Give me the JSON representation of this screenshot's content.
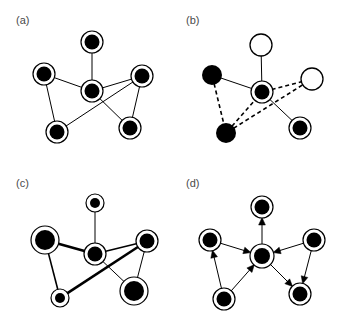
{
  "figure": {
    "background_color": "#ffffff",
    "node_fill_color": "#000000",
    "node_ring_color": "#000000",
    "open_node_fill_color": "#ffffff",
    "edge_color": "#000000",
    "label_color": "#4a4a4a",
    "width": 341,
    "height": 326
  },
  "panels": [
    {
      "id": "a",
      "label": "(a)",
      "caption": "undirected graph with uniform nodes and edges",
      "nodes": [
        {
          "id": "n1",
          "x": 92,
          "y": 42,
          "r_outer": 11,
          "r_inner": 7.5,
          "style": "filled-ring"
        },
        {
          "id": "n2",
          "x": 44,
          "y": 74,
          "r_outer": 11,
          "r_inner": 7.5,
          "style": "filled-ring"
        },
        {
          "id": "n3",
          "x": 92,
          "y": 91,
          "r_outer": 11,
          "r_inner": 7.5,
          "style": "filled-ring"
        },
        {
          "id": "n4",
          "x": 142,
          "y": 76,
          "r_outer": 11,
          "r_inner": 7.5,
          "style": "filled-ring"
        },
        {
          "id": "n5",
          "x": 57,
          "y": 132,
          "r_outer": 11,
          "r_inner": 7.5,
          "style": "filled-ring"
        },
        {
          "id": "n6",
          "x": 130,
          "y": 128,
          "r_outer": 11,
          "r_inner": 7.5,
          "style": "filled-ring"
        }
      ],
      "edges": [
        {
          "from": "n1",
          "to": "n3",
          "width": 1,
          "dash": "none"
        },
        {
          "from": "n2",
          "to": "n3",
          "width": 1,
          "dash": "none"
        },
        {
          "from": "n2",
          "to": "n5",
          "width": 1,
          "dash": "none"
        },
        {
          "from": "n3",
          "to": "n4",
          "width": 1,
          "dash": "none"
        },
        {
          "from": "n3",
          "to": "n6",
          "width": 1,
          "dash": "none"
        },
        {
          "from": "n4",
          "to": "n5",
          "width": 1,
          "dash": "none"
        },
        {
          "from": "n4",
          "to": "n6",
          "width": 1,
          "dash": "none"
        }
      ]
    },
    {
      "id": "b",
      "label": "(b)",
      "caption": "graph with two node types and two edge types",
      "nodes": [
        {
          "id": "n1",
          "x": 91,
          "y": 45,
          "r_outer": 11,
          "r_inner": 0,
          "style": "open"
        },
        {
          "id": "n2",
          "x": 42,
          "y": 75,
          "r_outer": 0,
          "r_inner": 10,
          "style": "filled-plain"
        },
        {
          "id": "n3",
          "x": 92,
          "y": 92,
          "r_outer": 11,
          "r_inner": 7.5,
          "style": "filled-ring"
        },
        {
          "id": "n4",
          "x": 142,
          "y": 79,
          "r_outer": 11,
          "r_inner": 0,
          "style": "open"
        },
        {
          "id": "n5",
          "x": 56,
          "y": 133,
          "r_outer": 0,
          "r_inner": 10,
          "style": "filled-plain"
        },
        {
          "id": "n6",
          "x": 130,
          "y": 128,
          "r_outer": 11,
          "r_inner": 7.5,
          "style": "filled-ring"
        }
      ],
      "edges": [
        {
          "from": "n1",
          "to": "n3",
          "width": 1,
          "dash": "none"
        },
        {
          "from": "n2",
          "to": "n3",
          "width": 1,
          "dash": "none"
        },
        {
          "from": "n3",
          "to": "n6",
          "width": 1,
          "dash": "none"
        },
        {
          "from": "n2",
          "to": "n5",
          "width": 1.6,
          "dash": "dashed"
        },
        {
          "from": "n5",
          "to": "n3",
          "width": 1.6,
          "dash": "dashed"
        },
        {
          "from": "n3",
          "to": "n4",
          "width": 1.6,
          "dash": "dashed"
        },
        {
          "from": "n5",
          "to": "n4",
          "width": 1.6,
          "dash": "dashed"
        }
      ]
    },
    {
      "id": "c",
      "label": "(c)",
      "caption": "weighted graph with varying node sizes and edge widths",
      "nodes": [
        {
          "id": "n1",
          "x": 95,
          "y": 40,
          "r_outer": 9,
          "r_inner": 5,
          "style": "filled-ring"
        },
        {
          "id": "n2",
          "x": 45,
          "y": 77,
          "r_outer": 14,
          "r_inner": 10,
          "style": "filled-ring"
        },
        {
          "id": "n3",
          "x": 95,
          "y": 91,
          "r_outer": 11,
          "r_inner": 7.5,
          "style": "filled-ring"
        },
        {
          "id": "n4",
          "x": 147,
          "y": 78,
          "r_outer": 11,
          "r_inner": 7.5,
          "style": "filled-ring"
        },
        {
          "id": "n5",
          "x": 60,
          "y": 135,
          "r_outer": 9,
          "r_inner": 5,
          "style": "filled-ring"
        },
        {
          "id": "n6",
          "x": 134,
          "y": 128,
          "r_outer": 14,
          "r_inner": 10,
          "style": "filled-ring"
        }
      ],
      "edges": [
        {
          "from": "n1",
          "to": "n3",
          "width": 1,
          "dash": "none"
        },
        {
          "from": "n2",
          "to": "n3",
          "width": 2.6,
          "dash": "none"
        },
        {
          "from": "n2",
          "to": "n5",
          "width": 1.6,
          "dash": "none"
        },
        {
          "from": "n3",
          "to": "n4",
          "width": 1.6,
          "dash": "none"
        },
        {
          "from": "n3",
          "to": "n6",
          "width": 1,
          "dash": "none"
        },
        {
          "from": "n4",
          "to": "n5",
          "width": 2.6,
          "dash": "none"
        },
        {
          "from": "n4",
          "to": "n6",
          "width": 1,
          "dash": "none"
        }
      ]
    },
    {
      "id": "d",
      "label": "(d)",
      "caption": "directed graph with arrowheads indicating edge direction",
      "nodes": [
        {
          "id": "n1",
          "x": 92,
          "y": 44,
          "r_outer": 11,
          "r_inner": 7.5,
          "style": "filled-ring"
        },
        {
          "id": "n2",
          "x": 40,
          "y": 77,
          "r_outer": 11,
          "r_inner": 7.5,
          "style": "filled-ring"
        },
        {
          "id": "n3",
          "x": 92,
          "y": 93,
          "r_outer": 12,
          "r_inner": 8,
          "style": "filled-ring"
        },
        {
          "id": "n4",
          "x": 144,
          "y": 77,
          "r_outer": 11,
          "r_inner": 7.5,
          "style": "filled-ring"
        },
        {
          "id": "n5",
          "x": 54,
          "y": 136,
          "r_outer": 11,
          "r_inner": 7.5,
          "style": "filled-ring"
        },
        {
          "id": "n6",
          "x": 130,
          "y": 131,
          "r_outer": 11,
          "r_inner": 7.5,
          "style": "filled-ring"
        }
      ],
      "edges": [
        {
          "from": "n3",
          "to": "n1",
          "width": 1,
          "dash": "none",
          "arrow": "to"
        },
        {
          "from": "n2",
          "to": "n3",
          "width": 1,
          "dash": "none",
          "arrow": "to"
        },
        {
          "from": "n5",
          "to": "n2",
          "width": 1,
          "dash": "none",
          "arrow": "to"
        },
        {
          "from": "n5",
          "to": "n3",
          "width": 1,
          "dash": "none",
          "arrow": "to"
        },
        {
          "from": "n4",
          "to": "n3",
          "width": 1,
          "dash": "none",
          "arrow": "to"
        },
        {
          "from": "n3",
          "to": "n6",
          "width": 1,
          "dash": "none",
          "arrow": "to"
        },
        {
          "from": "n4",
          "to": "n6",
          "width": 1,
          "dash": "none",
          "arrow": "to"
        }
      ]
    }
  ]
}
